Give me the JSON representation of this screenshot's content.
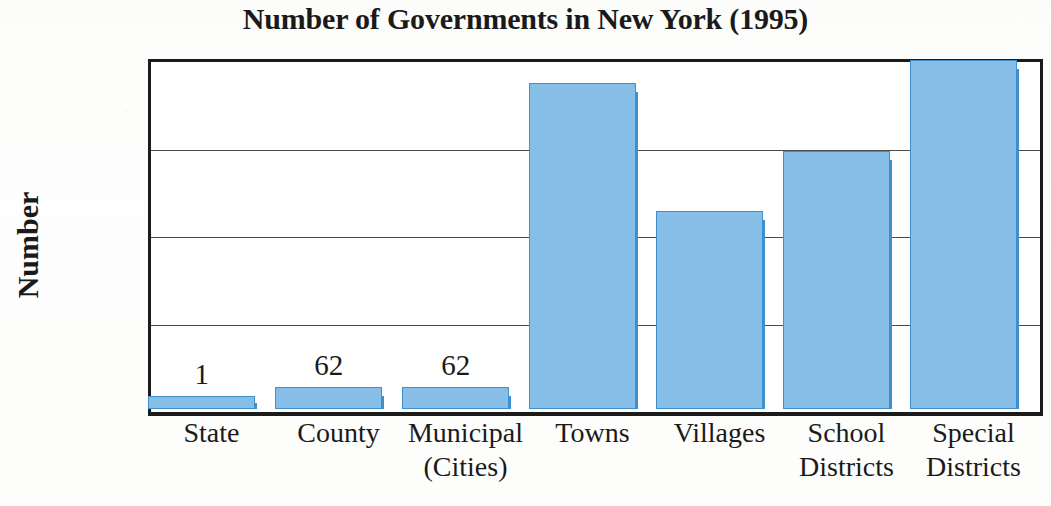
{
  "chart_data": {
    "type": "bar",
    "title": "Number of Governments in New York (1995)",
    "xlabel": "",
    "ylabel": "Number",
    "categories": [
      "State",
      "County",
      "Municipal (Cities)",
      "Towns",
      "Villages",
      "School Districts",
      "Special Districts"
    ],
    "category_lines": [
      [
        "State"
      ],
      [
        "County"
      ],
      [
        "Municipal",
        "(Cities)"
      ],
      [
        "Towns"
      ],
      [
        "Villages"
      ],
      [
        "School",
        "Districts"
      ],
      [
        "Special",
        "Districts"
      ]
    ],
    "values": [
      1,
      62,
      62,
      932,
      566,
      736,
      996
    ],
    "point_labels": [
      "1",
      "62",
      "62",
      "",
      "",
      "",
      ""
    ],
    "ylim": [
      0,
      1000
    ],
    "yticks": [
      0,
      250,
      500,
      750,
      1000
    ],
    "ytick_labels": [
      "0",
      "250",
      "500",
      "750",
      "1,000"
    ],
    "grid": "horizontal",
    "legend": "none",
    "colors": {
      "bar_fill": "#86bee8",
      "bar_edge": "#3f8fcc",
      "bar_shadow": "#3f8fcc",
      "axis": "#1b1b1b",
      "gridline": "#4a4a4a",
      "text": "#1a1a1a",
      "background": "#fdfdfc"
    }
  }
}
